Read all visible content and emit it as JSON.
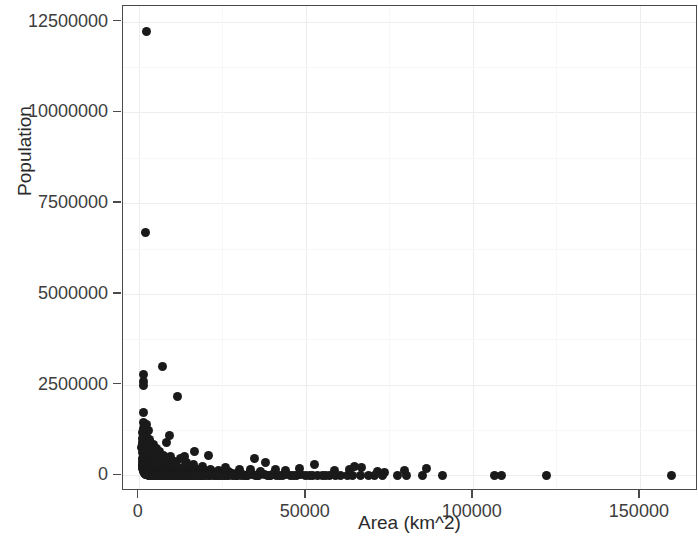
{
  "chart_data": {
    "type": "scatter",
    "title": "",
    "xlabel": "Area (km^2)",
    "ylabel": "Population",
    "xlim": [
      -4700,
      167400
    ],
    "ylim": [
      -430000,
      12930000
    ],
    "xticks": [
      0,
      50000,
      100000,
      150000
    ],
    "xticklabels": [
      "0",
      "50000",
      "100000",
      "150000"
    ],
    "yticks": [
      0,
      2500000,
      5000000,
      7500000,
      10000000,
      12500000
    ],
    "yticklabels": [
      "0",
      "2500000",
      "5000000",
      "7500000",
      "10000000",
      "12500000"
    ],
    "grid": true,
    "legend": null,
    "marker": {
      "shape": "circle",
      "color": "#1a1a1a",
      "size": 9
    },
    "point_count": 241,
    "points": [
      [
        2230,
        12220000
      ],
      [
        2150,
        6700000
      ],
      [
        1540,
        2790000
      ],
      [
        1490,
        2600000
      ],
      [
        1520,
        2470000
      ],
      [
        7100,
        3010000
      ],
      [
        11600,
        2180000
      ],
      [
        1280,
        1740000
      ],
      [
        1390,
        1450000
      ],
      [
        2450,
        1390000
      ],
      [
        1700,
        1330000
      ],
      [
        1360,
        1280000
      ],
      [
        2900,
        1230000
      ],
      [
        1180,
        1170000
      ],
      [
        1620,
        1120000
      ],
      [
        2340,
        1060000
      ],
      [
        980,
        1020000
      ],
      [
        3100,
        985000
      ],
      [
        1840,
        950000
      ],
      [
        1250,
        915000
      ],
      [
        2600,
        880000
      ],
      [
        4300,
        860000
      ],
      [
        1100,
        830000
      ],
      [
        3600,
        805000
      ],
      [
        1950,
        780000
      ],
      [
        900,
        760000
      ],
      [
        5200,
        735000
      ],
      [
        2780,
        710000
      ],
      [
        1470,
        690000
      ],
      [
        6100,
        670000
      ],
      [
        3300,
        650000
      ],
      [
        1060,
        630000
      ],
      [
        8300,
        905000
      ],
      [
        4900,
        610000
      ],
      [
        2200,
        590000
      ],
      [
        1320,
        575000
      ],
      [
        7400,
        560000
      ],
      [
        3850,
        545000
      ],
      [
        1760,
        530000
      ],
      [
        9600,
        515000
      ],
      [
        5500,
        500000
      ],
      [
        2500,
        488000
      ],
      [
        1150,
        475000
      ],
      [
        12400,
        462000
      ],
      [
        6700,
        450000
      ],
      [
        3050,
        440000
      ],
      [
        1480,
        430000
      ],
      [
        8900,
        420000
      ],
      [
        4400,
        410000
      ],
      [
        2050,
        400000
      ],
      [
        980,
        392000
      ],
      [
        10800,
        384000
      ],
      [
        5800,
        376000
      ],
      [
        2700,
        368000
      ],
      [
        1290,
        360000
      ],
      [
        14200,
        352000
      ],
      [
        7800,
        345000
      ],
      [
        3500,
        338000
      ],
      [
        1620,
        331000
      ],
      [
        9300,
        324000
      ],
      [
        4700,
        317000
      ],
      [
        2250,
        311000
      ],
      [
        1050,
        305000
      ],
      [
        16500,
        299000
      ],
      [
        6400,
        293000
      ],
      [
        3000,
        287000
      ],
      [
        1400,
        281000
      ],
      [
        11200,
        275000
      ],
      [
        5300,
        270000
      ],
      [
        2480,
        265000
      ],
      [
        1180,
        260000
      ],
      [
        13600,
        255000
      ],
      [
        7100,
        250000
      ],
      [
        3300,
        245000
      ],
      [
        1550,
        240000
      ],
      [
        19000,
        236000
      ],
      [
        8600,
        232000
      ],
      [
        4050,
        228000
      ],
      [
        1880,
        224000
      ],
      [
        10200,
        220000
      ],
      [
        5000,
        216000
      ],
      [
        2350,
        212000
      ],
      [
        1100,
        208000
      ],
      [
        15400,
        204000
      ],
      [
        6900,
        200000
      ],
      [
        3200,
        196000
      ],
      [
        1490,
        193000
      ],
      [
        12000,
        190000
      ],
      [
        5700,
        186000
      ],
      [
        2650,
        183000
      ],
      [
        1250,
        180000
      ],
      [
        21500,
        176000
      ],
      [
        9000,
        173000
      ],
      [
        4200,
        170000
      ],
      [
        1950,
        167000
      ],
      [
        17200,
        164000
      ],
      [
        7600,
        161000
      ],
      [
        3550,
        158000
      ],
      [
        1650,
        155000
      ],
      [
        13000,
        152000
      ],
      [
        6100,
        149000
      ],
      [
        2850,
        146000
      ],
      [
        1330,
        144000
      ],
      [
        24000,
        141000
      ],
      [
        10500,
        138000
      ],
      [
        4900,
        136000
      ],
      [
        2280,
        133000
      ],
      [
        18800,
        130000
      ],
      [
        8200,
        128000
      ],
      [
        3800,
        125000
      ],
      [
        1770,
        123000
      ],
      [
        14500,
        120000
      ],
      [
        6600,
        118000
      ],
      [
        3060,
        116000
      ],
      [
        1430,
        113000
      ],
      [
        27000,
        111000
      ],
      [
        11800,
        109000
      ],
      [
        5400,
        107000
      ],
      [
        2520,
        105000
      ],
      [
        20500,
        102000
      ],
      [
        9100,
        100000
      ],
      [
        4200,
        98000
      ],
      [
        1960,
        96000
      ],
      [
        16000,
        94000
      ],
      [
        7300,
        92000
      ],
      [
        3400,
        90000
      ],
      [
        1580,
        88000
      ],
      [
        30000,
        86000
      ],
      [
        13200,
        84000
      ],
      [
        6000,
        82000
      ],
      [
        2800,
        80000
      ],
      [
        22800,
        78000
      ],
      [
        10100,
        76000
      ],
      [
        4700,
        75000
      ],
      [
        2180,
        73000
      ],
      [
        17800,
        71000
      ],
      [
        8000,
        70000
      ],
      [
        3750,
        68000
      ],
      [
        1740,
        66000
      ],
      [
        33000,
        65000
      ],
      [
        14800,
        63000
      ],
      [
        6800,
        62000
      ],
      [
        3150,
        60000
      ],
      [
        25500,
        59000
      ],
      [
        11300,
        57000
      ],
      [
        5200,
        56000
      ],
      [
        2430,
        54000
      ],
      [
        19600,
        53000
      ],
      [
        8800,
        52000
      ],
      [
        4100,
        50000
      ],
      [
        1900,
        49000
      ],
      [
        36000,
        48000
      ],
      [
        16400,
        46000
      ],
      [
        7500,
        45000
      ],
      [
        3480,
        44000
      ],
      [
        28000,
        43000
      ],
      [
        12400,
        42000
      ],
      [
        5700,
        41000
      ],
      [
        2660,
        40000
      ],
      [
        21800,
        38000
      ],
      [
        9700,
        37000
      ],
      [
        4500,
        36000
      ],
      [
        2090,
        35000
      ],
      [
        40000,
        34000
      ],
      [
        18000,
        33000
      ],
      [
        8300,
        32000
      ],
      [
        3840,
        31000
      ],
      [
        31000,
        30000
      ],
      [
        13700,
        29000
      ],
      [
        6300,
        28000
      ],
      [
        2930,
        27000
      ],
      [
        24000,
        26000
      ],
      [
        10700,
        25500
      ],
      [
        4950,
        24800
      ],
      [
        2300,
        24000
      ],
      [
        44000,
        23200
      ],
      [
        19800,
        22400
      ],
      [
        9100,
        21700
      ],
      [
        4230,
        21000
      ],
      [
        34000,
        20300
      ],
      [
        15100,
        19600
      ],
      [
        6950,
        19000
      ],
      [
        3230,
        18400
      ],
      [
        26500,
        17800
      ],
      [
        11800,
        17200
      ],
      [
        5450,
        16600
      ],
      [
        2540,
        16000
      ],
      [
        48500,
        15500
      ],
      [
        21800,
        15000
      ],
      [
        10000,
        14500
      ],
      [
        4660,
        14000
      ],
      [
        37500,
        13500
      ],
      [
        16700,
        13000
      ],
      [
        7650,
        12600
      ],
      [
        3560,
        12200
      ],
      [
        29200,
        11800
      ],
      [
        13000,
        11400
      ],
      [
        6000,
        11000
      ],
      [
        2800,
        10600
      ],
      [
        53500,
        10200
      ],
      [
        24000,
        9900
      ],
      [
        11000,
        9500
      ],
      [
        5130,
        9200
      ],
      [
        41300,
        8900
      ],
      [
        18400,
        8600
      ],
      [
        8430,
        8300
      ],
      [
        3920,
        8000
      ],
      [
        32200,
        7700
      ],
      [
        14300,
        7400
      ],
      [
        6600,
        7100
      ],
      [
        3080,
        6900
      ],
      [
        59000,
        6600
      ],
      [
        26400,
        6400
      ],
      [
        12100,
        6100
      ],
      [
        5650,
        5900
      ],
      [
        45500,
        5700
      ],
      [
        20300,
        5500
      ],
      [
        9280,
        5300
      ],
      [
        4320,
        5100
      ],
      [
        35400,
        4900
      ],
      [
        15800,
        4700
      ],
      [
        7260,
        4500
      ],
      [
        3390,
        4300
      ],
      [
        64000,
        4200
      ],
      [
        29000,
        4000
      ],
      [
        13300,
        3800
      ],
      [
        6210,
        3700
      ],
      [
        50000,
        3500
      ],
      [
        22400,
        3400
      ],
      [
        10200,
        3200
      ],
      [
        4760,
        3100
      ],
      [
        39000,
        3000
      ],
      [
        17400,
        2800
      ],
      [
        7980,
        2700
      ],
      [
        3720,
        2600
      ],
      [
        70500,
        2500
      ],
      [
        31800,
        2400
      ],
      [
        14600,
        2300
      ],
      [
        6830,
        2200
      ],
      [
        55000,
        2100
      ],
      [
        24600,
        2000
      ],
      [
        11300,
        1900
      ],
      [
        5240,
        1800
      ],
      [
        43000,
        1700
      ],
      [
        19200,
        1600
      ],
      [
        8800,
        1550
      ],
      [
        4090,
        1500
      ],
      [
        77500,
        1400
      ],
      [
        35000,
        1350
      ],
      [
        16000,
        1300
      ],
      [
        7500,
        1250
      ],
      [
        60500,
        1200
      ],
      [
        27000,
        1150
      ],
      [
        12400,
        1100
      ],
      [
        5760,
        1050
      ],
      [
        47300,
        1000
      ],
      [
        21100,
        960
      ],
      [
        9700,
        920
      ],
      [
        4500,
        880
      ],
      [
        85000,
        840
      ],
      [
        38400,
        800
      ],
      [
        17600,
        780
      ],
      [
        8200,
        750
      ],
      [
        66500,
        720
      ],
      [
        29700,
        690
      ],
      [
        13600,
        660
      ],
      [
        6340,
        640
      ],
      [
        52000,
        610
      ],
      [
        23200,
        590
      ],
      [
        10600,
        570
      ],
      [
        4950,
        550
      ],
      [
        91000,
        530
      ],
      [
        42200,
        510
      ],
      [
        19300,
        490
      ],
      [
        9000,
        470
      ],
      [
        73000,
        450
      ],
      [
        32600,
        430
      ],
      [
        15000,
        420
      ],
      [
        6960,
        400
      ],
      [
        57000,
        390
      ],
      [
        25500,
        375
      ],
      [
        11700,
        360
      ],
      [
        5440,
        345
      ],
      [
        106500,
        330
      ],
      [
        46400,
        320
      ],
      [
        21200,
        305
      ],
      [
        9900,
        295
      ],
      [
        80000,
        285
      ],
      [
        35800,
        275
      ],
      [
        16400,
        265
      ],
      [
        7650,
        255
      ],
      [
        62600,
        245
      ],
      [
        28000,
        235
      ],
      [
        12800,
        228
      ],
      [
        5980,
        220
      ],
      [
        108500,
        212
      ],
      [
        51000,
        204
      ],
      [
        23300,
        196
      ],
      [
        10900,
        190
      ],
      [
        122000,
        182
      ],
      [
        39300,
        175
      ],
      [
        18000,
        168
      ],
      [
        8400,
        162
      ],
      [
        68700,
        156
      ],
      [
        30700,
        150
      ],
      [
        14100,
        145
      ],
      [
        6570,
        140
      ],
      [
        159500,
        250
      ],
      [
        56000,
        130
      ],
      [
        25600,
        125
      ],
      [
        11900,
        120
      ],
      [
        9300,
        1090000
      ],
      [
        34500,
        480000
      ],
      [
        52500,
        310000
      ],
      [
        44000,
        140000
      ],
      [
        63000,
        175000
      ],
      [
        71500,
        95000
      ],
      [
        86000,
        185000
      ],
      [
        64500,
        240000
      ],
      [
        66800,
        210000
      ],
      [
        79500,
        130000
      ],
      [
        38000,
        360000
      ],
      [
        41000,
        155000
      ],
      [
        58500,
        145000
      ],
      [
        73500,
        88000
      ],
      [
        48000,
        190000
      ],
      [
        33500,
        165000
      ],
      [
        36500,
        118000
      ],
      [
        20800,
        555000
      ],
      [
        26000,
        208000
      ],
      [
        30200,
        152000
      ],
      [
        16800,
        672000
      ],
      [
        13800,
        520000
      ]
    ]
  },
  "panel": {
    "background_color": "#ffffff",
    "border_color": "#4a4a4a",
    "gridline_color": "#ededed"
  }
}
